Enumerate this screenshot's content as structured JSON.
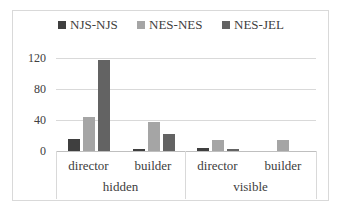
{
  "chart_data": {
    "type": "bar",
    "title": "",
    "xlabel": "",
    "ylabel": "",
    "ylim": [
      0,
      120
    ],
    "yticks": [
      "0",
      "40",
      "80",
      "120"
    ],
    "grid": true,
    "legend_position": "top",
    "category_groups": [
      {
        "label": "hidden",
        "categories": [
          "director",
          "builder"
        ]
      },
      {
        "label": "visible",
        "categories": [
          "director",
          "builder"
        ]
      }
    ],
    "categories": [
      "hidden / director",
      "hidden / builder",
      "visible / director",
      "visible / builder"
    ],
    "series": [
      {
        "name": "NJS-NJS",
        "color": "#3f3f3f",
        "values": [
          15,
          3,
          4,
          0
        ]
      },
      {
        "name": "NES-NES",
        "color": "#a5a5a5",
        "values": [
          44,
          38,
          14,
          14
        ]
      },
      {
        "name": "NES-JEL",
        "color": "#636363",
        "values": [
          118,
          22,
          2,
          0
        ]
      }
    ]
  },
  "legend": {
    "items": [
      {
        "label": "NJS-NJS",
        "color": "#3f3f3f"
      },
      {
        "label": "NES-NES",
        "color": "#a5a5a5"
      },
      {
        "label": "NES-JEL",
        "color": "#636363"
      }
    ]
  },
  "axis": {
    "y_ticks": [
      "120",
      "80",
      "40",
      "0"
    ],
    "x_inner": [
      "director",
      "builder",
      "director",
      "builder"
    ],
    "x_outer": [
      "hidden",
      "visible"
    ]
  }
}
